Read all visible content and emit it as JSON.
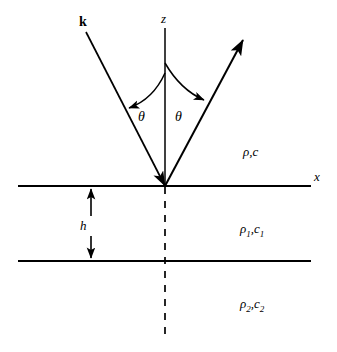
{
  "figure": {
    "type": "acoustic-reflection-geometry",
    "background_color": "#ffffff",
    "stroke_color": "#000000"
  },
  "axes": {
    "z_label": "z",
    "x_label": "x"
  },
  "rays": {
    "incident_label": "k",
    "incident_description": "incident wave vector arrow pointing down-right to origin",
    "reflected_description": "reflected ray arrow pointing up-right from origin"
  },
  "angles": {
    "incident_theta": "θ",
    "reflected_theta": "θ"
  },
  "layers": {
    "upper_medium": {
      "symbol": "ρ,c",
      "density": "ρ",
      "speed": "c"
    },
    "middle_medium": {
      "density": "ρ",
      "density_sub": "1",
      "speed": "c",
      "speed_sub": "1",
      "separator": ","
    },
    "lower_medium": {
      "density": "ρ",
      "density_sub": "2",
      "speed": "c",
      "speed_sub": "2",
      "separator": ","
    }
  },
  "thickness": {
    "label": "h"
  }
}
